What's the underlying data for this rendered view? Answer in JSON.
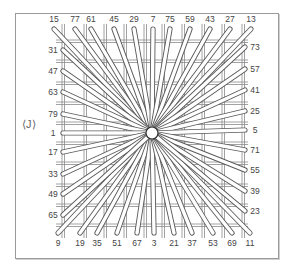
{
  "figure": {
    "symbol": "⟨J⟩",
    "center": {
      "x": 152,
      "y": 133
    },
    "line_color": "#5a5a5a",
    "grid_color": "#8a8a8a"
  },
  "labels": {
    "top": [
      "15",
      "77",
      "61",
      "45",
      "29",
      "7",
      "75",
      "59",
      "43",
      "27",
      "13"
    ],
    "bottom": [
      "9",
      "19",
      "35",
      "51",
      "67",
      "3",
      "21",
      "37",
      "53",
      "69",
      "11"
    ],
    "left": [
      "31",
      "47",
      "63",
      "79",
      "1",
      "17",
      "33",
      "49",
      "65"
    ],
    "right": [
      "73",
      "57",
      "41",
      "25",
      "5",
      "71",
      "55",
      "39",
      "23"
    ]
  },
  "label_positions": {
    "top": [
      [
        54,
        19
      ],
      [
        75,
        19
      ],
      [
        91,
        19
      ],
      [
        114,
        19
      ],
      [
        134,
        19
      ],
      [
        153,
        19
      ],
      [
        170,
        19
      ],
      [
        190,
        19
      ],
      [
        210,
        19
      ],
      [
        230,
        19
      ],
      [
        251,
        19
      ]
    ],
    "bottom": [
      [
        58,
        243
      ],
      [
        80,
        243
      ],
      [
        97,
        243
      ],
      [
        117,
        243
      ],
      [
        137,
        243
      ],
      [
        154,
        243
      ],
      [
        174,
        243
      ],
      [
        192,
        243
      ],
      [
        213,
        243
      ],
      [
        232,
        243
      ],
      [
        250,
        243
      ]
    ],
    "left": [
      [
        53,
        50
      ],
      [
        53,
        71
      ],
      [
        53,
        92
      ],
      [
        53,
        114
      ],
      [
        53,
        133
      ],
      [
        53,
        152
      ],
      [
        53,
        174
      ],
      [
        53,
        194
      ],
      [
        53,
        215
      ]
    ],
    "right": [
      [
        255,
        47
      ],
      [
        255,
        69
      ],
      [
        255,
        90
      ],
      [
        255,
        111
      ],
      [
        255,
        130
      ],
      [
        255,
        150
      ],
      [
        255,
        170
      ],
      [
        255,
        191
      ],
      [
        255,
        211
      ]
    ]
  }
}
